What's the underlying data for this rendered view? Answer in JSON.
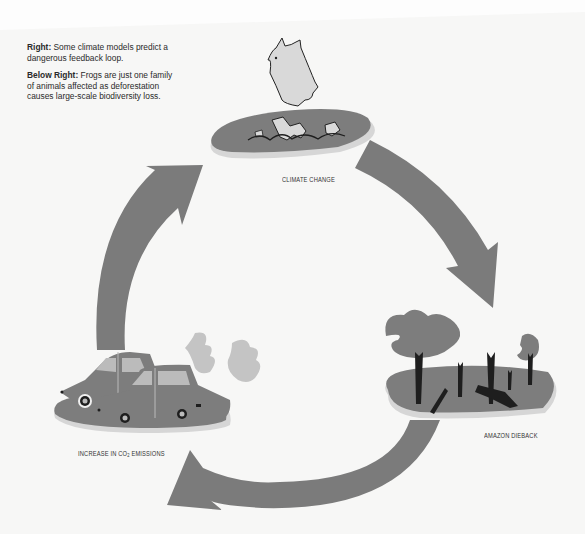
{
  "captions": [
    {
      "lead": "Right:",
      "text": " Some climate models predict a dangerous feedback loop."
    },
    {
      "lead": "Below Right:",
      "text": " Frogs are just one family of animals affected as deforestation causes large-scale biodiversity loss."
    }
  ],
  "cycle": {
    "nodes": [
      {
        "id": "climate-change",
        "label": "CLIMATE CHANGE",
        "icon": "polar-bear-on-melting-ice-icon"
      },
      {
        "id": "amazon-dieback",
        "label": "AMAZON DIEBACK",
        "icon": "dead-trees-icon"
      },
      {
        "id": "co2-emissions",
        "label_pre": "INCREASE IN CO",
        "label_sub": "2",
        "label_post": " EMISSIONS",
        "icon": "cars-exhaust-icon"
      }
    ],
    "arrows": [
      {
        "from": "climate-change",
        "to": "amazon-dieback"
      },
      {
        "from": "amazon-dieback",
        "to": "co2-emissions"
      },
      {
        "from": "co2-emissions",
        "to": "climate-change"
      }
    ]
  },
  "colors": {
    "arrow": "#7b7b7b",
    "island": "#7d7d7d",
    "island_shadow": "#d6d6d6",
    "ice": "#d9d9d9",
    "smoke": "#c4c4c4",
    "tree_trunk": "#1e1e1e"
  }
}
